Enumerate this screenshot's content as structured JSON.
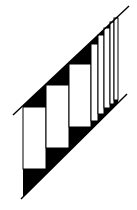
{
  "figure": {
    "width": 137,
    "height": 210,
    "colors": {
      "ink": "#000000",
      "paper": "#ffffff"
    },
    "upper_line": {
      "x1": 13,
      "y1": 115,
      "x2": 129,
      "y2": 6
    },
    "lower_line": {
      "x1": 21,
      "y1": 199,
      "x2": 127,
      "y2": 94
    },
    "panels": [
      {
        "x": 23,
        "top": 107,
        "bottom": 169,
        "right": 46
      },
      {
        "x": 46,
        "top": 85,
        "bottom": 148,
        "right": 69
      },
      {
        "x": 69,
        "top": 64,
        "bottom": 127,
        "right": 91
      },
      {
        "x": 91,
        "top": 44,
        "bottom": 121,
        "right": 98
      },
      {
        "x": 98,
        "top": 35,
        "bottom": 114,
        "right": 104
      },
      {
        "x": 104,
        "top": 28,
        "bottom": 108,
        "right": 110
      },
      {
        "x": 110,
        "top": 22,
        "bottom": 104,
        "right": 114
      },
      {
        "x": 114,
        "top": 18,
        "bottom": 100,
        "right": 118
      }
    ]
  }
}
